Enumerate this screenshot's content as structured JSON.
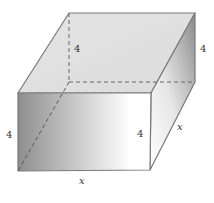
{
  "diagram": {
    "type": "3d-box",
    "vertices": {
      "front_top_left": [
        18,
        93
      ],
      "front_top_right": [
        151,
        93
      ],
      "front_bottom_left": [
        18,
        171
      ],
      "front_bottom_right": [
        150,
        170
      ],
      "back_top_left": [
        69,
        13
      ],
      "back_top_right": [
        195,
        13
      ],
      "back_bottom_right": [
        195,
        82
      ],
      "back_bottom_left_hidden": [
        69,
        82
      ]
    },
    "labels": {
      "back_height": "4",
      "right_back_height": "4",
      "left_front_height": "4",
      "front_right_height": "4",
      "front_width": "x",
      "depth": "x"
    },
    "colors": {
      "edge": "#7a7a7a",
      "hidden_edge": "#666666",
      "top_face": "#e2e2e2",
      "front_dark": "#8e8e8e",
      "front_light": "#ffffff",
      "side_dark": "#8a8a8a",
      "side_light": "#ffffff"
    }
  }
}
